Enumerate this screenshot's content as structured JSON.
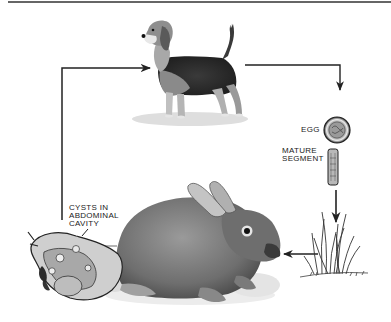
{
  "diagram": {
    "type": "life-cycle",
    "stages": [
      {
        "id": "dog",
        "label": "",
        "role": "definitive host"
      },
      {
        "id": "egg",
        "label": "EGG"
      },
      {
        "id": "segment",
        "label": "MATURE\nSEGMENT"
      },
      {
        "id": "grass",
        "label": ""
      },
      {
        "id": "rabbit",
        "label": "",
        "role": "intermediate host"
      },
      {
        "id": "cysts",
        "label": "CYSTS IN\nABDOMINAL\nCAVITY"
      }
    ],
    "flow": [
      "dog",
      "egg",
      "segment",
      "grass",
      "rabbit",
      "cysts",
      "dog"
    ]
  },
  "labels": {
    "egg": "EGG",
    "mature_segment": "MATURE\nSEGMENT",
    "cysts": "CYSTS IN\nABDOMINAL\nCAVITY"
  },
  "colors": {
    "line": "#222222",
    "fur_dark": "#2a2a2a",
    "fur_mid": "#8a8a8a",
    "fur_light": "#c8c8c8",
    "shadow": "#dcdcdc"
  }
}
